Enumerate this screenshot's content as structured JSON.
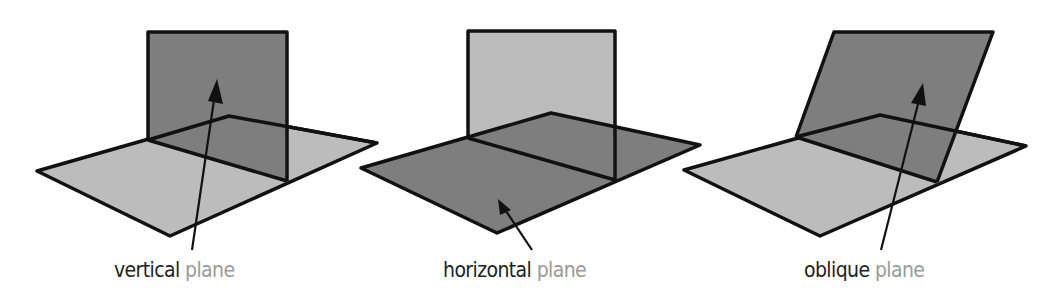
{
  "colors": {
    "dark_plane": "#7e7e7e",
    "light_plane": "#bcbcbc",
    "outline": "#111111",
    "label_main": "#222222",
    "label_sub": "#9a9a9a"
  },
  "figures": [
    {
      "id": "vertical",
      "label_main": "vertical",
      "label_sub": "plane",
      "highlighted": "vertical-plane"
    },
    {
      "id": "horizontal",
      "label_main": "horizontal",
      "label_sub": "plane",
      "highlighted": "horizontal-plane"
    },
    {
      "id": "oblique",
      "label_main": "oblique",
      "label_sub": "plane",
      "highlighted": "oblique-plane"
    }
  ]
}
